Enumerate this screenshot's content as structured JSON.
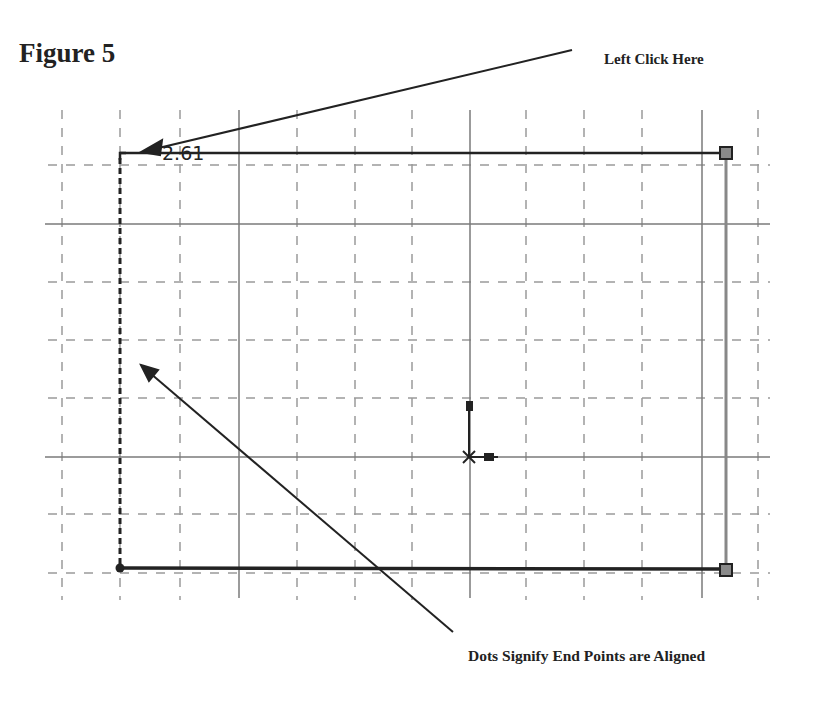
{
  "figure": {
    "title": "Figure 5",
    "callouts": [
      {
        "id": "left-click",
        "text": "Left Click Here"
      },
      {
        "id": "dots-aligned",
        "text": "Dots Signify End  Points are Aligned"
      }
    ],
    "dimension_label": "2.61"
  },
  "colors": {
    "grid_minor": "#9a9a9a",
    "grid_major": "#7a7a7a",
    "sketch_line": "#222222",
    "handle_fill": "#8a8a8a"
  }
}
